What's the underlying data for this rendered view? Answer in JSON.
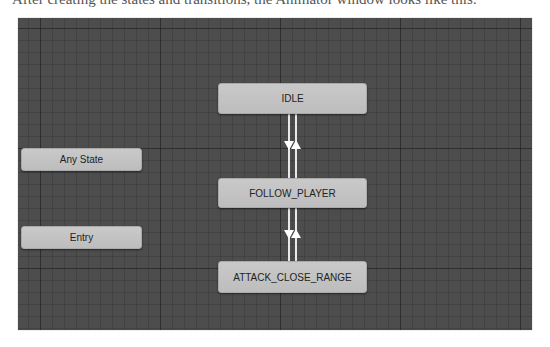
{
  "caption": "After creating the states and transitions, the Animator window looks like this:",
  "animator": {
    "states": {
      "idle": {
        "label": "IDLE"
      },
      "follow_player": {
        "label": "FOLLOW_PLAYER"
      },
      "attack_close_range": {
        "label": "ATTACK_CLOSE_RANGE"
      },
      "any_state": {
        "label": "Any State"
      },
      "entry": {
        "label": "Entry"
      }
    },
    "transitions": [
      {
        "from": "IDLE",
        "to": "FOLLOW_PLAYER"
      },
      {
        "from": "FOLLOW_PLAYER",
        "to": "IDLE"
      },
      {
        "from": "FOLLOW_PLAYER",
        "to": "ATTACK_CLOSE_RANGE"
      },
      {
        "from": "ATTACK_CLOSE_RANGE",
        "to": "FOLLOW_PLAYER"
      }
    ],
    "colors": {
      "canvas": "#4d4d4d",
      "node": "#c4c4c4",
      "transition": "#e8e8e8"
    }
  }
}
